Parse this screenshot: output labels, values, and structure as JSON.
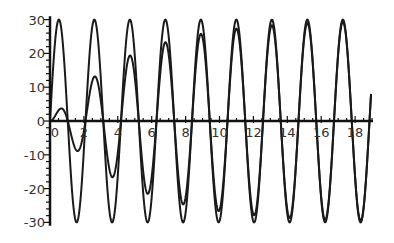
{
  "chart_data": {
    "type": "line",
    "title": "",
    "xlabel": "",
    "ylabel": "",
    "xlim": [
      0,
      19
    ],
    "ylim": [
      -30,
      30
    ],
    "grid": false,
    "legend": null,
    "x_ticks": [
      "0",
      "2",
      "4",
      "6",
      "8",
      "10",
      "12",
      "14",
      "16",
      "18"
    ],
    "y_ticks": [
      "-30",
      "-20",
      "-10",
      "0",
      "10",
      "20",
      "30"
    ],
    "x_tick_values": [
      0,
      2,
      4,
      6,
      8,
      10,
      12,
      14,
      16,
      18
    ],
    "y_tick_values": [
      -30,
      -20,
      -10,
      0,
      10,
      20,
      30
    ],
    "series": [
      {
        "name": "steady-state oscillation",
        "model": "30*sin(3t)",
        "amplitude": 30,
        "omega": 3,
        "decay": 0,
        "extrema": [
          {
            "t": 0.52,
            "y": 30
          },
          {
            "t": 1.57,
            "y": -30
          },
          {
            "t": 2.62,
            "y": 30
          },
          {
            "t": 3.67,
            "y": -30
          },
          {
            "t": 4.71,
            "y": 30
          },
          {
            "t": 5.76,
            "y": -30
          },
          {
            "t": 6.81,
            "y": 30
          },
          {
            "t": 7.85,
            "y": -30
          },
          {
            "t": 8.9,
            "y": 30
          },
          {
            "t": 9.95,
            "y": -30
          },
          {
            "t": 11.0,
            "y": 30
          },
          {
            "t": 12.04,
            "y": -30
          },
          {
            "t": 13.09,
            "y": 30
          },
          {
            "t": 14.14,
            "y": -30
          },
          {
            "t": 15.18,
            "y": 30
          },
          {
            "t": 16.23,
            "y": -30
          },
          {
            "t": 17.28,
            "y": 30
          },
          {
            "t": 18.33,
            "y": -30
          }
        ]
      },
      {
        "name": "growing oscillation",
        "model": "30*(1-exp(-0.22t))*sin(3t)",
        "amplitude": 30,
        "omega": 3,
        "decay": 0.22,
        "extrema": [
          {
            "t": 0.52,
            "y": 3.3
          },
          {
            "t": 1.57,
            "y": -8.8
          },
          {
            "t": 2.62,
            "y": 13.1
          },
          {
            "t": 3.67,
            "y": -16.6
          },
          {
            "t": 4.71,
            "y": 19.4
          },
          {
            "t": 5.76,
            "y": -21.7
          },
          {
            "t": 6.81,
            "y": 23.3
          },
          {
            "t": 7.85,
            "y": -24.7
          },
          {
            "t": 8.9,
            "y": 25.8
          },
          {
            "t": 9.95,
            "y": -26.7
          },
          {
            "t": 11.0,
            "y": 27.3
          },
          {
            "t": 12.04,
            "y": -27.9
          },
          {
            "t": 13.09,
            "y": 28.3
          },
          {
            "t": 14.14,
            "y": -28.7
          },
          {
            "t": 15.18,
            "y": 28.9
          },
          {
            "t": 16.23,
            "y": -29.1
          },
          {
            "t": 17.28,
            "y": 29.3
          },
          {
            "t": 18.33,
            "y": -29.5
          }
        ]
      }
    ]
  },
  "style": {
    "line_color": "#1a1a1a",
    "axis_color": "#111111",
    "label_color": "#333333"
  },
  "layout": {
    "origin_x": 50,
    "origin_y": 121,
    "px_per_x": 16.95,
    "px_per_y": 3.38,
    "x_axis_end": 373
  }
}
